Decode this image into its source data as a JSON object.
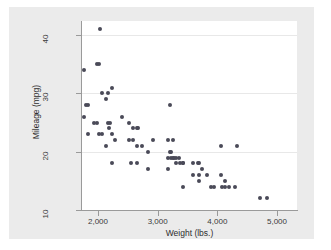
{
  "chart_data": {
    "type": "scatter",
    "title": "",
    "xlabel": "Weight (lbs.)",
    "ylabel": "Mileage (mpg)",
    "xlim": [
      1600,
      5000
    ],
    "ylim": [
      10,
      42
    ],
    "xticks": [
      2000,
      3000,
      4000,
      5000
    ],
    "xtick_labels": [
      "2,000",
      "3,000",
      "4,000",
      "5,000"
    ],
    "yticks": [
      10,
      20,
      30,
      40
    ],
    "ytick_labels": [
      "10",
      "20",
      "30",
      "40"
    ],
    "grid": "horizontal",
    "legend": "none",
    "marker_color": "#4a4a58",
    "plot_background": "#ffffff",
    "canvas_background": "#ebebeb",
    "series": [
      {
        "name": "Mileage vs Weight",
        "points": [
          [
            2040,
            41
          ],
          [
            1760,
            34
          ],
          [
            1980,
            35
          ],
          [
            2020,
            35
          ],
          [
            2070,
            30
          ],
          [
            2160,
            30
          ],
          [
            2130,
            29
          ],
          [
            2230,
            31
          ],
          [
            1800,
            28
          ],
          [
            1830,
            28
          ],
          [
            1760,
            26
          ],
          [
            1930,
            25
          ],
          [
            1980,
            25
          ],
          [
            2160,
            25
          ],
          [
            2200,
            25
          ],
          [
            2190,
            24
          ],
          [
            2410,
            26
          ],
          [
            2520,
            25
          ],
          [
            2580,
            24
          ],
          [
            2650,
            24
          ],
          [
            2670,
            24
          ],
          [
            1830,
            23
          ],
          [
            2020,
            23
          ],
          [
            2070,
            23
          ],
          [
            2240,
            23
          ],
          [
            2290,
            22
          ],
          [
            2130,
            21
          ],
          [
            2520,
            22
          ],
          [
            2580,
            22
          ],
          [
            2650,
            21
          ],
          [
            2730,
            21
          ],
          [
            2830,
            20
          ],
          [
            2930,
            22
          ],
          [
            3170,
            22
          ],
          [
            3250,
            22
          ],
          [
            3210,
            28
          ],
          [
            3200,
            20
          ],
          [
            3230,
            20
          ],
          [
            3170,
            19
          ],
          [
            3220,
            19
          ],
          [
            3260,
            19
          ],
          [
            3280,
            19
          ],
          [
            3300,
            19
          ],
          [
            3350,
            19
          ],
          [
            3310,
            18
          ],
          [
            3370,
            18
          ],
          [
            3420,
            18
          ],
          [
            3430,
            18
          ],
          [
            2240,
            18
          ],
          [
            2560,
            18
          ],
          [
            2650,
            18
          ],
          [
            2830,
            17
          ],
          [
            3180,
            17
          ],
          [
            3600,
            18
          ],
          [
            3670,
            18
          ],
          [
            3690,
            18
          ],
          [
            3600,
            16
          ],
          [
            3690,
            16
          ],
          [
            3700,
            15
          ],
          [
            3740,
            17
          ],
          [
            3830,
            16
          ],
          [
            3900,
            14
          ],
          [
            3950,
            14
          ],
          [
            4060,
            16
          ],
          [
            4070,
            14
          ],
          [
            4130,
            15
          ],
          [
            4130,
            14
          ],
          [
            4190,
            14
          ],
          [
            4290,
            14
          ],
          [
            3420,
            14
          ],
          [
            4060,
            21
          ],
          [
            4330,
            21
          ],
          [
            4720,
            12
          ],
          [
            4840,
            12
          ]
        ]
      }
    ]
  },
  "axes": {
    "x_tick_positions_px": [
      89,
      149,
      208,
      268
    ],
    "y_tick_positions_px": [
      203,
      145,
      86,
      28
    ]
  }
}
